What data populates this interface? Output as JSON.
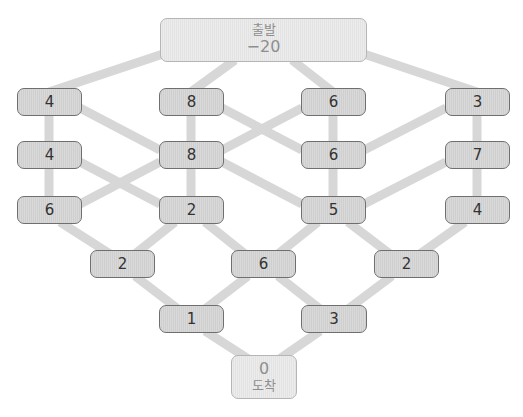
{
  "start": {
    "label": "출발",
    "value": "−20"
  },
  "end": {
    "value": "0",
    "label": "도착"
  },
  "rows": [
    [
      "4",
      "8",
      "6",
      "3"
    ],
    [
      "4",
      "8",
      "6",
      "7"
    ],
    [
      "6",
      "2",
      "5",
      "4"
    ],
    [
      "2",
      "6",
      "2"
    ],
    [
      "1",
      "3"
    ]
  ],
  "colors": {
    "edge": "#d4d4d4",
    "node_border": "#6f6f6f",
    "node_fill": "#d6d6d6",
    "terminal_border": "#b5b5b5",
    "terminal_text": "#8e8e8e"
  }
}
